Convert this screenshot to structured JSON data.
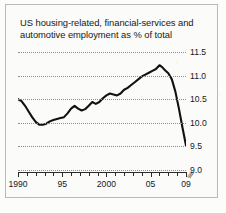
{
  "figure": {
    "background_color": "#fbfbfa",
    "border_color": "#b9b9b6",
    "line_color": "#111111",
    "grid_color": "#8d8d8a",
    "text_color": "#15181c"
  },
  "title": {
    "line1": "US housing-related, financial-services and",
    "line2": "automotive employment as % of total"
  },
  "axis_break_symbol": "⫻",
  "chart_data": {
    "type": "line",
    "title": "US housing-related, financial-services and automotive employment as % of total",
    "xlabel": "",
    "ylabel": "",
    "ylim": [
      9.0,
      11.5
    ],
    "xlim": [
      1990,
      2009
    ],
    "grid": true,
    "legend": false,
    "y_ticks": [
      "9.0",
      "9.5",
      "10.0",
      "10.5",
      "11.0",
      "11.5"
    ],
    "y_tick_values": [
      9.0,
      9.5,
      10.0,
      10.5,
      11.0,
      11.5
    ],
    "x_ticks": [
      "1990",
      "95",
      "2000",
      "05",
      "09"
    ],
    "x_tick_values": [
      1990,
      1995,
      2000,
      2005,
      2009
    ],
    "x_minor_tick_values": [
      1990,
      1991,
      1992,
      1993,
      1994,
      1995,
      1996,
      1997,
      1998,
      1999,
      2000,
      2001,
      2002,
      2003,
      2004,
      2005,
      2006,
      2007,
      2008,
      2009
    ],
    "series": [
      {
        "name": "US housing-related, financial-services and automotive employment",
        "x": [
          1990.0,
          1990.4,
          1990.8,
          1991.2,
          1991.6,
          1992.0,
          1992.4,
          1992.8,
          1993.2,
          1993.6,
          1994.0,
          1994.4,
          1994.8,
          1995.2,
          1995.6,
          1996.0,
          1996.4,
          1996.8,
          1997.2,
          1997.6,
          1998.0,
          1998.4,
          1998.8,
          1999.2,
          1999.6,
          2000.0,
          2000.4,
          2000.8,
          2001.2,
          2001.6,
          2002.0,
          2002.4,
          2002.8,
          2003.2,
          2003.6,
          2004.0,
          2004.4,
          2004.8,
          2005.2,
          2005.6,
          2006.0,
          2006.3,
          2006.6,
          2007.0,
          2007.4,
          2007.8,
          2008.2,
          2008.6,
          2009.0
        ],
        "values": [
          10.5,
          10.46,
          10.36,
          10.24,
          10.12,
          10.02,
          9.96,
          9.96,
          9.98,
          10.03,
          10.06,
          10.08,
          10.1,
          10.12,
          10.2,
          10.3,
          10.36,
          10.3,
          10.26,
          10.29,
          10.36,
          10.44,
          10.4,
          10.44,
          10.52,
          10.58,
          10.62,
          10.6,
          10.58,
          10.62,
          10.7,
          10.74,
          10.8,
          10.86,
          10.92,
          10.98,
          11.02,
          11.06,
          11.1,
          11.14,
          11.22,
          11.18,
          11.12,
          11.05,
          10.92,
          10.66,
          10.3,
          9.9,
          9.52
        ]
      }
    ]
  }
}
